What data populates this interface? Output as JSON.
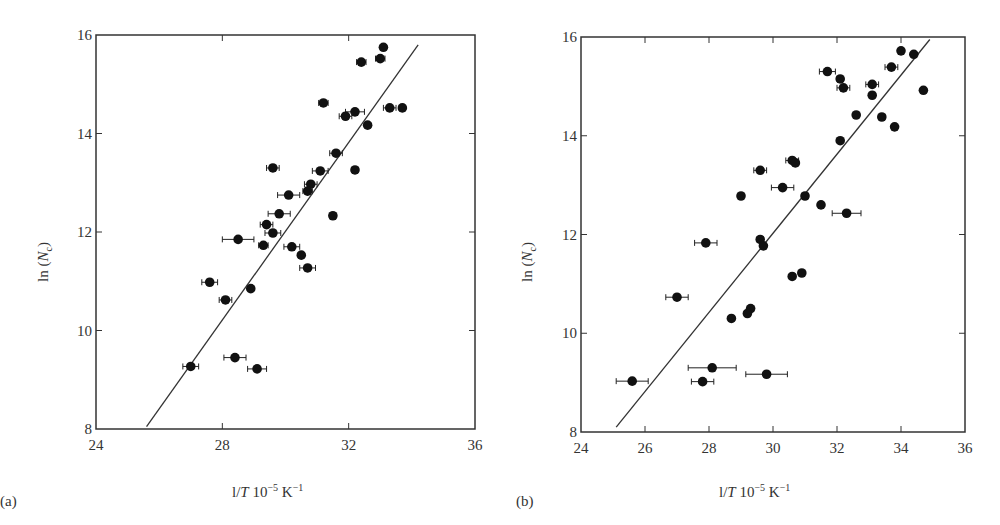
{
  "chart_data": [
    {
      "panel": "(a)",
      "type": "scatter",
      "xlabel": "l/T 10^-5 K^-1",
      "ylabel": "ln (Nc)",
      "xlim": [
        24,
        36
      ],
      "ylim": [
        8,
        16
      ],
      "xticks": [
        24,
        28,
        32,
        36
      ],
      "yticks": [
        8,
        10,
        12,
        14,
        16
      ],
      "grid": false,
      "legend": null,
      "fit_line": {
        "x": [
          25.6,
          34.2
        ],
        "y": [
          8.05,
          15.8
        ]
      },
      "points": [
        {
          "x": 33.1,
          "y": 15.75,
          "xerr": 0.1
        },
        {
          "x": 33.0,
          "y": 15.52,
          "xerr": 0.15
        },
        {
          "x": 32.4,
          "y": 15.45,
          "xerr": 0.15
        },
        {
          "x": 31.2,
          "y": 14.62,
          "xerr": 0.15
        },
        {
          "x": 32.2,
          "y": 14.44,
          "xerr": 0.3
        },
        {
          "x": 31.9,
          "y": 14.35,
          "xerr": 0.2
        },
        {
          "x": 33.3,
          "y": 14.52,
          "xerr": 0.2
        },
        {
          "x": 33.7,
          "y": 14.52,
          "xerr": 0.1
        },
        {
          "x": 32.6,
          "y": 14.17,
          "xerr": 0.1
        },
        {
          "x": 31.6,
          "y": 13.6,
          "xerr": 0.2
        },
        {
          "x": 29.6,
          "y": 13.3,
          "xerr": 0.2
        },
        {
          "x": 31.1,
          "y": 13.24,
          "xerr": 0.25
        },
        {
          "x": 32.2,
          "y": 13.26,
          "xerr": 0.1
        },
        {
          "x": 30.8,
          "y": 12.97,
          "xerr": 0.2
        },
        {
          "x": 30.1,
          "y": 12.75,
          "xerr": 0.35
        },
        {
          "x": 30.7,
          "y": 12.83,
          "xerr": 0.15
        },
        {
          "x": 29.8,
          "y": 12.37,
          "xerr": 0.35
        },
        {
          "x": 31.5,
          "y": 12.33,
          "xerr": 0.1
        },
        {
          "x": 29.4,
          "y": 12.15,
          "xerr": 0.2
        },
        {
          "x": 29.6,
          "y": 11.98,
          "xerr": 0.25
        },
        {
          "x": 28.5,
          "y": 11.85,
          "xerr": 0.5
        },
        {
          "x": 29.3,
          "y": 11.73,
          "xerr": 0.15
        },
        {
          "x": 30.2,
          "y": 11.7,
          "xerr": 0.25
        },
        {
          "x": 30.5,
          "y": 11.53,
          "xerr": 0.1
        },
        {
          "x": 30.7,
          "y": 11.27,
          "xerr": 0.25
        },
        {
          "x": 27.6,
          "y": 10.98,
          "xerr": 0.25
        },
        {
          "x": 28.9,
          "y": 10.85,
          "xerr": 0.0
        },
        {
          "x": 28.1,
          "y": 10.62,
          "xerr": 0.2
        },
        {
          "x": 27.0,
          "y": 9.27,
          "xerr": 0.25
        },
        {
          "x": 28.4,
          "y": 9.45,
          "xerr": 0.35
        },
        {
          "x": 29.1,
          "y": 9.22,
          "xerr": 0.3
        }
      ]
    },
    {
      "panel": "(b)",
      "type": "scatter",
      "xlabel": "l/T 10^-5 K^-1",
      "ylabel": "ln (Nc)",
      "xlim": [
        24,
        36
      ],
      "ylim": [
        8,
        16
      ],
      "xticks": [
        24,
        26,
        28,
        30,
        32,
        34,
        36
      ],
      "yticks": [
        8,
        10,
        12,
        14,
        16
      ],
      "grid": false,
      "legend": null,
      "fit_line": {
        "x": [
          25.1,
          34.9
        ],
        "y": [
          8.1,
          15.95
        ]
      },
      "points": [
        {
          "x": 34.0,
          "y": 15.72,
          "xerr": 0.0
        },
        {
          "x": 34.4,
          "y": 15.65,
          "xerr": 0.0
        },
        {
          "x": 33.7,
          "y": 15.39,
          "xerr": 0.2
        },
        {
          "x": 31.7,
          "y": 15.3,
          "xerr": 0.25
        },
        {
          "x": 32.1,
          "y": 15.15,
          "xerr": 0.1
        },
        {
          "x": 32.2,
          "y": 14.97,
          "xerr": 0.2
        },
        {
          "x": 33.1,
          "y": 15.04,
          "xerr": 0.2
        },
        {
          "x": 33.1,
          "y": 14.82,
          "xerr": 0.0
        },
        {
          "x": 34.7,
          "y": 14.92,
          "xerr": 0.0
        },
        {
          "x": 32.6,
          "y": 14.42,
          "xerr": 0.0
        },
        {
          "x": 33.4,
          "y": 14.38,
          "xerr": 0.1
        },
        {
          "x": 33.8,
          "y": 14.18,
          "xerr": 0.0
        },
        {
          "x": 32.1,
          "y": 13.9,
          "xerr": 0.0
        },
        {
          "x": 30.6,
          "y": 13.5,
          "xerr": 0.2
        },
        {
          "x": 30.7,
          "y": 13.45,
          "xerr": 0.1
        },
        {
          "x": 29.6,
          "y": 13.3,
          "xerr": 0.2
        },
        {
          "x": 30.3,
          "y": 12.95,
          "xerr": 0.35
        },
        {
          "x": 29.0,
          "y": 12.78,
          "xerr": 0.0
        },
        {
          "x": 31.0,
          "y": 12.78,
          "xerr": 0.1
        },
        {
          "x": 31.5,
          "y": 12.6,
          "xerr": 0.0
        },
        {
          "x": 32.3,
          "y": 12.43,
          "xerr": 0.45
        },
        {
          "x": 27.9,
          "y": 11.83,
          "xerr": 0.35
        },
        {
          "x": 29.6,
          "y": 11.9,
          "xerr": 0.1
        },
        {
          "x": 29.7,
          "y": 11.77,
          "xerr": 0.0
        },
        {
          "x": 30.6,
          "y": 11.15,
          "xerr": 0.0
        },
        {
          "x": 30.9,
          "y": 11.22,
          "xerr": 0.0
        },
        {
          "x": 27.0,
          "y": 10.73,
          "xerr": 0.35
        },
        {
          "x": 29.3,
          "y": 10.5,
          "xerr": 0.1
        },
        {
          "x": 29.2,
          "y": 10.4,
          "xerr": 0.0
        },
        {
          "x": 28.7,
          "y": 10.3,
          "xerr": 0.0
        },
        {
          "x": 28.1,
          "y": 9.3,
          "xerr": 0.75
        },
        {
          "x": 29.8,
          "y": 9.17,
          "xerr": 0.65
        },
        {
          "x": 27.8,
          "y": 9.02,
          "xerr": 0.35
        },
        {
          "x": 25.6,
          "y": 9.03,
          "xerr": 0.5
        }
      ]
    }
  ],
  "labels": {
    "panel_a": "(a)",
    "panel_b": "(b)",
    "x_axis_prefix": "l/",
    "x_axis_T": "T",
    "x_axis_mid": " 10",
    "x_axis_exp1": "−5",
    "x_axis_unit": " K",
    "x_axis_exp2": "−1",
    "y_axis_ln": "ln (",
    "y_axis_N": "N",
    "y_axis_sub": "c",
    "y_axis_close": ")"
  }
}
